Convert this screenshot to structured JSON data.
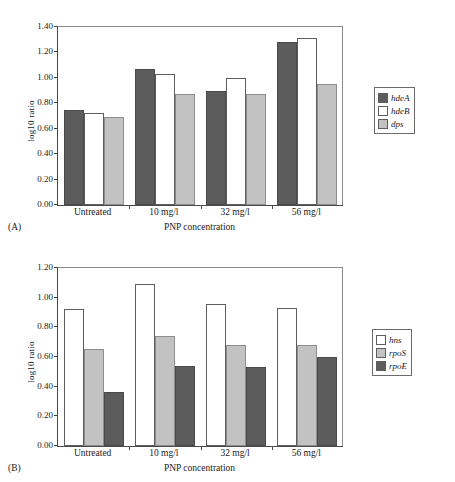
{
  "figure": {
    "panels": [
      {
        "tag": "(A)",
        "xlabel": "PNP concentration",
        "ylabel": "log10 ratio",
        "categories": [
          "Untreated",
          "10 mg/l",
          "32 mg/l",
          "56 mg/l"
        ],
        "yticks": [
          "0.00",
          "0.20",
          "0.40",
          "0.60",
          "0.80",
          "1.00",
          "1.20",
          "1.40"
        ],
        "legend": [
          {
            "label": "hdeA",
            "fill": "dark"
          },
          {
            "label": "hdeB",
            "fill": "white"
          },
          {
            "label": "dps",
            "fill": "light"
          }
        ]
      },
      {
        "tag": "(B)",
        "xlabel": "PNP concentration",
        "ylabel": "log10 ratio",
        "categories": [
          "Untreated",
          "10 mg/l",
          "32 mg/l",
          "56 mg/l"
        ],
        "yticks": [
          "0.00",
          "0.20",
          "0.40",
          "0.60",
          "0.80",
          "1.00",
          "1.20"
        ],
        "legend": [
          {
            "label": "hns",
            "fill": "white"
          },
          {
            "label": "rpoS",
            "fill": "light"
          },
          {
            "label": "rpoE",
            "fill": "dark"
          }
        ]
      }
    ]
  },
  "chart_data": [
    {
      "type": "bar",
      "title": "",
      "panel": "(A)",
      "xlabel": "PNP concentration",
      "ylabel": "log10 ratio",
      "ylim": [
        0.0,
        1.4
      ],
      "ytick_step": 0.2,
      "grid": false,
      "legend_position": "right",
      "categories": [
        "Untreated",
        "10 mg/l",
        "32 mg/l",
        "56 mg/l"
      ],
      "series": [
        {
          "name": "hdeA",
          "fill": "dark",
          "values": [
            0.75,
            1.07,
            0.9,
            1.28
          ]
        },
        {
          "name": "hdeB",
          "fill": "white",
          "values": [
            0.72,
            1.03,
            1.0,
            1.31
          ]
        },
        {
          "name": "dps",
          "fill": "light",
          "values": [
            0.69,
            0.87,
            0.875,
            0.955
          ]
        }
      ]
    },
    {
      "type": "bar",
      "title": "",
      "panel": "(B)",
      "xlabel": "PNP concentration",
      "ylabel": "log10 ratio",
      "ylim": [
        0.0,
        1.2
      ],
      "ytick_step": 0.2,
      "grid": false,
      "legend_position": "right",
      "categories": [
        "Untreated",
        "10 mg/l",
        "32 mg/l",
        "56 mg/l"
      ],
      "series": [
        {
          "name": "hns",
          "fill": "white",
          "values": [
            0.925,
            1.09,
            0.96,
            0.93
          ]
        },
        {
          "name": "rpoS",
          "fill": "light",
          "values": [
            0.655,
            0.745,
            0.68,
            0.68
          ]
        },
        {
          "name": "rpoE",
          "fill": "dark",
          "values": [
            0.365,
            0.54,
            0.535,
            0.6
          ]
        }
      ]
    }
  ]
}
